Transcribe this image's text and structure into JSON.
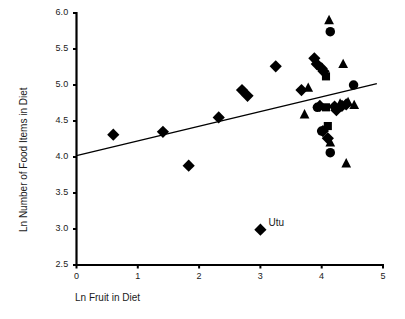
{
  "chart_data": {
    "type": "scatter",
    "title": "",
    "xlabel": "Ln Fruit in Diet",
    "ylabel": "Ln Number of Food Items in Diet",
    "xlim": [
      0,
      5
    ],
    "ylim": [
      2.5,
      6.0
    ],
    "xticks": [
      "0",
      "1",
      "2",
      "3",
      "4",
      "5"
    ],
    "yticks": [
      "2.5",
      "3.0",
      "3.5",
      "4.0",
      "4.5",
      "5.0",
      "5.5",
      "6.0"
    ],
    "xtick_values": [
      0,
      1,
      2,
      3,
      4,
      5
    ],
    "ytick_values": [
      2.5,
      3.0,
      3.5,
      4.0,
      4.5,
      5.0,
      5.5,
      6.0
    ],
    "grid": false,
    "legend": "none",
    "marker_color": "#000000",
    "axis_color": "#000000",
    "trendline": {
      "name": "regression-line",
      "x0": 0.0,
      "y0": 4.02,
      "x1": 4.9,
      "y1": 5.02,
      "color": "#000000",
      "width": 1.3
    },
    "annotations": [
      {
        "text": "Utu",
        "x": 3.1,
        "y": 3.07
      }
    ],
    "series": [
      {
        "name": "diamonds",
        "marker": "diamond",
        "points": [
          [
            0.6,
            4.31
          ],
          [
            1.41,
            4.35
          ],
          [
            1.83,
            3.88
          ],
          [
            2.32,
            4.55
          ],
          [
            2.7,
            4.93
          ],
          [
            2.79,
            4.85
          ],
          [
            3.25,
            5.26
          ],
          [
            3.0,
            2.99
          ],
          [
            3.67,
            4.93
          ],
          [
            3.88,
            5.37
          ],
          [
            3.92,
            5.29
          ],
          [
            4.0,
            5.23
          ],
          [
            4.03,
            5.19
          ],
          [
            3.97,
            4.71
          ],
          [
            4.02,
            4.36
          ],
          [
            4.1,
            4.26
          ],
          [
            4.24,
            4.65
          ],
          [
            4.33,
            4.71
          ],
          [
            4.21,
            4.7
          ],
          [
            4.4,
            4.73
          ]
        ]
      },
      {
        "name": "triangles",
        "marker": "triangle",
        "points": [
          [
            4.12,
            5.9
          ],
          [
            4.35,
            5.29
          ],
          [
            3.78,
            4.96
          ],
          [
            3.72,
            4.59
          ],
          [
            4.14,
            4.2
          ],
          [
            4.3,
            4.74
          ],
          [
            4.43,
            4.76
          ],
          [
            4.53,
            4.72
          ],
          [
            4.4,
            3.91
          ]
        ]
      },
      {
        "name": "circles",
        "marker": "circle",
        "points": [
          [
            4.14,
            5.74
          ],
          [
            4.52,
            5.0
          ],
          [
            3.93,
            4.69
          ],
          [
            4.0,
            4.36
          ],
          [
            4.14,
            4.06
          ]
        ]
      },
      {
        "name": "squares",
        "marker": "square",
        "points": [
          [
            4.07,
            5.12
          ],
          [
            4.07,
            4.69
          ],
          [
            4.1,
            4.43
          ]
        ]
      }
    ]
  }
}
